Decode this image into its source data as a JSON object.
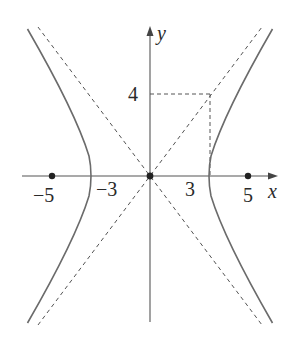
{
  "diagram": {
    "type": "hyperbola",
    "equation": "x^2/9 - y^2/16 = 1",
    "axes": {
      "x_label": "x",
      "y_label": "y"
    },
    "x_ticks": [
      {
        "value": -5,
        "label": "−5"
      },
      {
        "value": -3,
        "label": "−3"
      },
      {
        "value": 3,
        "label": "3"
      },
      {
        "value": 5,
        "label": "5"
      }
    ],
    "y_ticks": [
      {
        "value": 4,
        "label": "4"
      }
    ],
    "foci": [
      [
        -5,
        0
      ],
      [
        5,
        0
      ]
    ],
    "center": [
      0,
      0
    ],
    "vertices": [
      [
        -3,
        0
      ],
      [
        3,
        0
      ]
    ],
    "asymptotes": [
      "y = 4x/3",
      "y = -4x/3"
    ],
    "reference_box_corner": [
      3,
      4
    ],
    "colors": {
      "curve": "#6b6b6b",
      "axis": "#555555",
      "dashed": "#555555",
      "point": "#222222"
    }
  }
}
